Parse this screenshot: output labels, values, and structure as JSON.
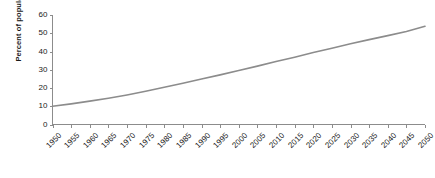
{
  "chart_data": {
    "type": "line",
    "title": "",
    "xlabel": "",
    "ylabel": "Percent of population",
    "xlim": [
      1950,
      2050
    ],
    "ylim": [
      0,
      60
    ],
    "grid": false,
    "legend": false,
    "line_color": "#8c8c8c",
    "axis_color": "#8c8c8c",
    "text_color": "#1a1a1a",
    "background": "#ffffff",
    "yticks": [
      0,
      10,
      20,
      30,
      40,
      50,
      60
    ],
    "ytick_labels": [
      "0",
      "10",
      "20",
      "30",
      "40",
      "50",
      "60"
    ],
    "x": [
      1950,
      1955,
      1960,
      1965,
      1970,
      1975,
      1980,
      1985,
      1990,
      1995,
      2000,
      2005,
      2010,
      2015,
      2020,
      2025,
      2030,
      2035,
      2040,
      2045,
      2050
    ],
    "xtick_labels": [
      "1950",
      "1955",
      "1960",
      "1965",
      "1970",
      "1975",
      "1980",
      "1985",
      "1990",
      "1995",
      "2000",
      "2005",
      "2010",
      "2015",
      "2020",
      "2025",
      "2030",
      "2035",
      "2040",
      "2045",
      "2050"
    ],
    "series": [
      {
        "name": "Percent of population",
        "values": [
          10.0,
          11.3,
          12.8,
          14.4,
          16.2,
          18.2,
          20.4,
          22.6,
          24.9,
          27.2,
          29.6,
          32.0,
          34.5,
          36.9,
          39.4,
          41.8,
          44.2,
          46.5,
          48.7,
          51.0,
          53.8
        ]
      }
    ]
  }
}
